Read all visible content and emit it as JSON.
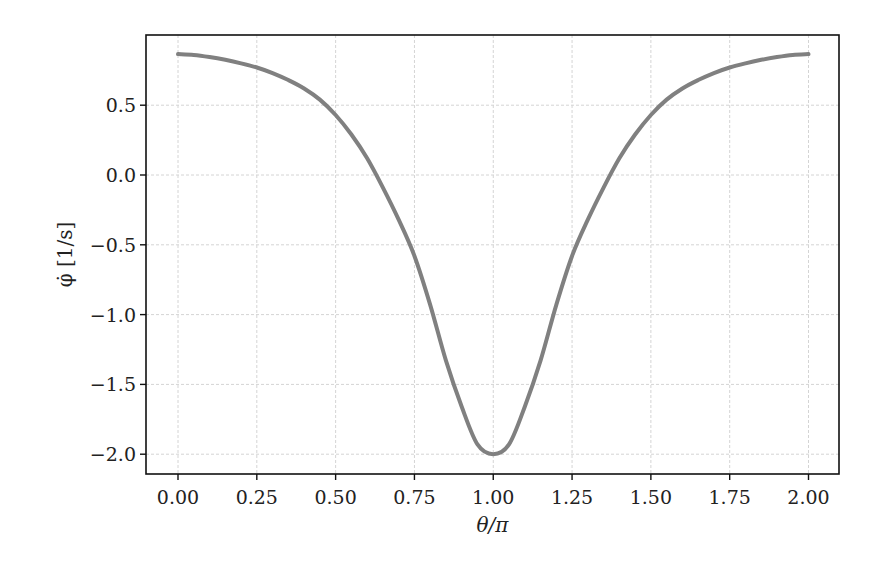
{
  "chart_data": {
    "type": "line",
    "title": "",
    "xlabel": "θ/π",
    "ylabel": "φ̇ [1/s]",
    "xlim": [
      -0.1,
      2.1
    ],
    "ylim": [
      -2.14,
      0.95
    ],
    "grid": true,
    "legend": null,
    "xticks": [
      0.0,
      0.25,
      0.5,
      0.75,
      1.0,
      1.25,
      1.5,
      1.75,
      2.0
    ],
    "xtick_labels": [
      "0.00",
      "0.25",
      "0.50",
      "0.75",
      "1.00",
      "1.25",
      "1.50",
      "1.75",
      "2.00"
    ],
    "yticks": [
      0.5,
      0.0,
      -0.5,
      -1.0,
      -1.5,
      -2.0
    ],
    "ytick_labels": [
      "0.5",
      "0.0",
      "−0.5",
      "−1.0",
      "−1.5",
      "−2.0"
    ],
    "series": [
      {
        "name": "phi_dot",
        "color": "#808080",
        "x": [
          0.0,
          0.05,
          0.1,
          0.15,
          0.2,
          0.25,
          0.3,
          0.35,
          0.4,
          0.45,
          0.5,
          0.55,
          0.6,
          0.65,
          0.7,
          0.75,
          0.8,
          0.85,
          0.9,
          0.95,
          1.0,
          1.05,
          1.1,
          1.15,
          1.2,
          1.25,
          1.3,
          1.35,
          1.4,
          1.45,
          1.5,
          1.55,
          1.6,
          1.65,
          1.7,
          1.75,
          1.8,
          1.85,
          1.9,
          1.95,
          2.0
        ],
        "values": [
          0.866,
          0.86,
          0.845,
          0.825,
          0.8,
          0.77,
          0.73,
          0.68,
          0.62,
          0.54,
          0.43,
          0.29,
          0.12,
          -0.09,
          -0.32,
          -0.58,
          -0.93,
          -1.33,
          -1.66,
          -1.93,
          -2.0,
          -1.93,
          -1.66,
          -1.33,
          -0.93,
          -0.58,
          -0.32,
          -0.09,
          0.12,
          0.29,
          0.43,
          0.54,
          0.62,
          0.68,
          0.73,
          0.77,
          0.8,
          0.825,
          0.845,
          0.86,
          0.866
        ]
      }
    ]
  },
  "layout": {
    "axes_px": {
      "left": 146,
      "right": 839,
      "top": 35,
      "bottom": 474
    },
    "x_px": {
      "zero": 178,
      "per_unit": 315.25
    },
    "y_px": {
      "zero": 175,
      "per_unit": 139.6
    }
  }
}
